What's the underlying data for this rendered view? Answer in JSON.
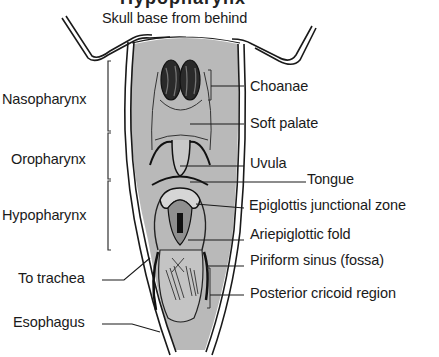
{
  "figure": {
    "top_caption": "Skull base from behind",
    "cut_title": "Hypopharynx"
  },
  "regions": [
    {
      "label": "Nasopharynx"
    },
    {
      "label": "Oropharynx"
    },
    {
      "label": "Hypopharynx"
    }
  ],
  "left_labels": [
    {
      "label": "To trachea"
    },
    {
      "label": "Esophagus"
    }
  ],
  "right_labels": [
    {
      "label": "Choanae"
    },
    {
      "label": "Soft palate"
    },
    {
      "label": "Uvula"
    },
    {
      "label": "Tongue"
    },
    {
      "label": "Epiglottis junctional zone"
    },
    {
      "label": "Ariepiglottic fold"
    },
    {
      "label": "Piriform sinus (fossa)"
    },
    {
      "label": "Posterior cricoid region"
    }
  ],
  "colors": {
    "tissue_fill": "#b9b9b9",
    "ink": "#1a1a1a",
    "background": "#ffffff"
  }
}
